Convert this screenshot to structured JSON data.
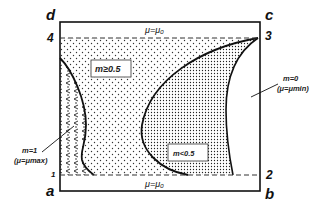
{
  "diagram": {
    "corners": {
      "top_left": "d",
      "top_right": "c",
      "bottom_left": "a",
      "bottom_right": "b"
    },
    "points": {
      "p1": "1",
      "p2": "2",
      "p3": "3",
      "p4": "4"
    },
    "top_boundary_label": "μ=μ₀",
    "bottom_boundary_label": "μ=μ₀",
    "regions": {
      "upper_label": "m≥0.5",
      "lower_label": "m<0.5"
    },
    "left_callout": {
      "line1": "m=1",
      "line2": "(μ=μmax)"
    },
    "right_callout": {
      "line1": "m=0",
      "line2": "(μ=μmin)"
    },
    "colors": {
      "line": "#111111",
      "background": "#ffffff",
      "dots": "#333333"
    }
  }
}
